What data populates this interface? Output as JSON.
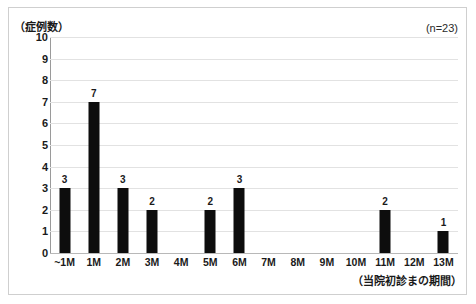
{
  "chart_data": {
    "type": "bar",
    "title": "",
    "subtitle": "",
    "categories": [
      "~1M",
      "1M",
      "2M",
      "3M",
      "4M",
      "5M",
      "6M",
      "7M",
      "8M",
      "9M",
      "10M",
      "11M",
      "12M",
      "13M"
    ],
    "values": [
      3,
      7,
      3,
      2,
      0,
      2,
      3,
      0,
      0,
      0,
      0,
      2,
      0,
      1
    ],
    "xlabel": "（当院初診まの期間）",
    "ylabel": "（症例数）",
    "ylim": [
      0,
      10
    ],
    "ytick_labels": [
      "10",
      "9",
      "8",
      "7",
      "6",
      "5",
      "4",
      "3",
      "2",
      "1",
      "0"
    ],
    "ytick_values": [
      10,
      9,
      8,
      7,
      6,
      5,
      4,
      3,
      2,
      1,
      0
    ],
    "ytick_step": 1,
    "grid": true,
    "grid_axis": "y",
    "legend": false,
    "legend_position": "none",
    "show_data_labels": true,
    "annotations": [
      {
        "name": "sample-size",
        "text": "(n=23)",
        "position": "top-right"
      }
    ],
    "bar_color": "#0d0d0d",
    "gridline_color": "#e2e2e2",
    "axis_color": "#9a9a9a",
    "background_color": "#ffffff",
    "border_color": "#cfcfcf"
  }
}
